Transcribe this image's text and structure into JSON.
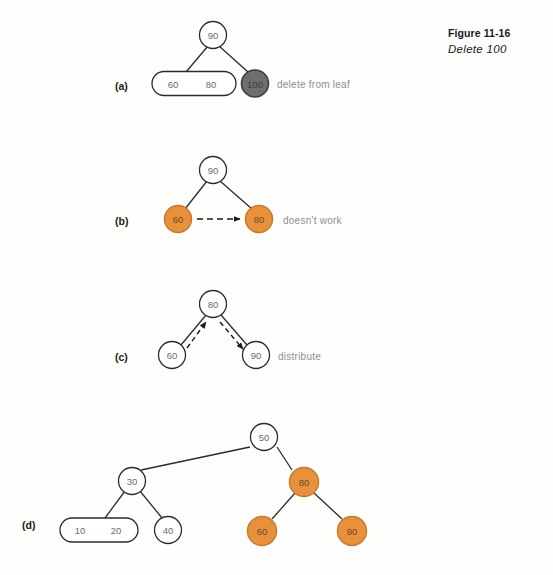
{
  "page": {
    "running_header": "",
    "background": "#fffffe"
  },
  "caption": {
    "number": "Figure 11-16",
    "title": "Delete 100"
  },
  "colors": {
    "orange_fill": "#e8913c",
    "orange_stroke": "#c77a2e",
    "gray_fill": "#6e6e6e",
    "gray_stroke": "#3c3c3c",
    "white_fill": "#ffffff",
    "node_stroke": "#2b2b2b",
    "edge": "#2b2b2b",
    "dashed_arrow": "#1a1a1a",
    "annotation_text": "#8e8e8e",
    "label_text": "#1a1a1a"
  },
  "panels": [
    {
      "id": "a",
      "label": "(a)",
      "annotation": "delete from leaf",
      "nodes": [
        {
          "name": "root-90",
          "values": [
            "90"
          ],
          "shape": "circle",
          "fill": "white"
        },
        {
          "name": "leaf-60-80",
          "values": [
            "60",
            "80"
          ],
          "shape": "stadium",
          "fill": "white"
        },
        {
          "name": "leaf-100",
          "values": [
            "100"
          ],
          "shape": "circle",
          "fill": "gray"
        }
      ]
    },
    {
      "id": "b",
      "label": "(b)",
      "annotation": "doesn't work",
      "nodes": [
        {
          "name": "root-90",
          "values": [
            "90"
          ],
          "shape": "circle",
          "fill": "white"
        },
        {
          "name": "leaf-60",
          "values": [
            "60"
          ],
          "shape": "circle",
          "fill": "orange"
        },
        {
          "name": "leaf-80",
          "values": [
            "80"
          ],
          "shape": "circle",
          "fill": "orange"
        }
      ],
      "arrows": [
        {
          "name": "dashed-arrow-60-to-80",
          "from": "60",
          "to": "80",
          "style": "dashed"
        }
      ]
    },
    {
      "id": "c",
      "label": "(c)",
      "annotation": "distribute",
      "nodes": [
        {
          "name": "root-80",
          "values": [
            "80"
          ],
          "shape": "circle",
          "fill": "white"
        },
        {
          "name": "leaf-60",
          "values": [
            "60"
          ],
          "shape": "circle",
          "fill": "white"
        },
        {
          "name": "leaf-90",
          "values": [
            "90"
          ],
          "shape": "circle",
          "fill": "white"
        }
      ],
      "arrows": [
        {
          "name": "dashed-arrow-60-to-80",
          "from": "60",
          "to": "80",
          "style": "dashed"
        },
        {
          "name": "dashed-arrow-80-to-90",
          "from": "80",
          "to": "90",
          "style": "dashed"
        }
      ]
    },
    {
      "id": "d",
      "label": "(d)",
      "annotation": "",
      "nodes": [
        {
          "name": "root-50",
          "values": [
            "50"
          ],
          "shape": "circle",
          "fill": "white"
        },
        {
          "name": "node-30",
          "values": [
            "30"
          ],
          "shape": "circle",
          "fill": "white"
        },
        {
          "name": "node-80",
          "values": [
            "80"
          ],
          "shape": "circle",
          "fill": "orange"
        },
        {
          "name": "leaf-10-20",
          "values": [
            "10",
            "20"
          ],
          "shape": "stadium",
          "fill": "white"
        },
        {
          "name": "leaf-40",
          "values": [
            "40"
          ],
          "shape": "circle",
          "fill": "white"
        },
        {
          "name": "leaf-60",
          "values": [
            "60"
          ],
          "shape": "circle",
          "fill": "orange"
        },
        {
          "name": "leaf-90",
          "values": [
            "90"
          ],
          "shape": "circle",
          "fill": "orange"
        }
      ]
    }
  ],
  "node_values": {
    "a": {
      "root": "90",
      "leaf_left_1": "60",
      "leaf_left_2": "80",
      "leaf_right": "100"
    },
    "b": {
      "root": "90",
      "left": "60",
      "right": "80"
    },
    "c": {
      "root": "80",
      "left": "60",
      "right": "90"
    },
    "d": {
      "root": "50",
      "l1": "30",
      "r1": "80",
      "l2a": "10",
      "l2b": "20",
      "l2c": "40",
      "r2a": "60",
      "r2b": "90"
    }
  }
}
